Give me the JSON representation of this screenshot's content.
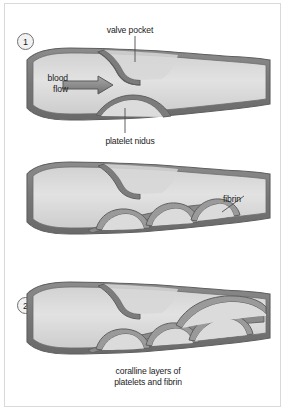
{
  "figure": {
    "background_color": "#ffffff",
    "border_color": "#d9d9d9",
    "width": 286,
    "height": 411
  },
  "colors": {
    "vessel_wall": "#7b7b7b",
    "vessel_wall_dark": "#636363",
    "lumen_light": "#dedede",
    "lumen_mid": "#cfcfcf",
    "thrombus_fill": "#d2d2d2",
    "outline": "#5f5f5f",
    "text": "#1b1b1b",
    "arrow": "#8a8a8a"
  },
  "panels": [
    {
      "number": "1",
      "name": "panel-one-valve-pocket",
      "description": "Vein with valve pocket and blood flow; platelet nidus begins to form in the pocket"
    },
    {
      "number": "2",
      "name": "panel-two-fibrin",
      "description": "Thrombus grows with successive layers of platelets and fibrin"
    },
    {
      "number": "3",
      "name": "panel-three-coralline",
      "description": "Coralline layered thrombus largely fills the vein lumen"
    }
  ],
  "labels": {
    "valve_pocket": "valve pocket",
    "blood_flow": "blood\nflow",
    "blood_flow_line1": "blood",
    "blood_flow_line2": "flow",
    "platelet_nidus": "platelet nidus",
    "fibrin": "fibrin",
    "coralline_line1": "coralline layers of",
    "coralline_line2": "platelets and fibrin"
  },
  "icons": {
    "flow_arrow": "right-arrow-icon",
    "step_marker": "circled-number-icon"
  }
}
